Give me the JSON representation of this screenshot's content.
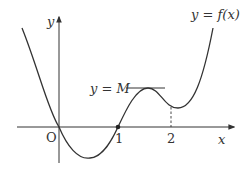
{
  "diagram": {
    "title": "",
    "function_label": "y = f(x)",
    "function_label_parts": {
      "lhs": "y",
      "eq": " = ",
      "rhs": "f(x)"
    },
    "axes": {
      "x_label": "x",
      "y_label": "y",
      "origin_label": "O",
      "x_ticks": [
        "1",
        "2"
      ]
    },
    "horizontal_line_label": "y = M",
    "horizontal_line_parts": {
      "lhs": "y",
      "eq": " = ",
      "rhs": "M"
    },
    "marked_point": {
      "x": 1,
      "y": 0
    },
    "dashed_guide_x": 2,
    "curve_description": "Graph of y = f(x) passing through origin, dipping below x-axis, crossing at x = 1, reaching local maximum y = M, local minimum just after x = 2, then rising",
    "colors": {
      "stroke": "#333333",
      "background": "#ffffff"
    }
  }
}
